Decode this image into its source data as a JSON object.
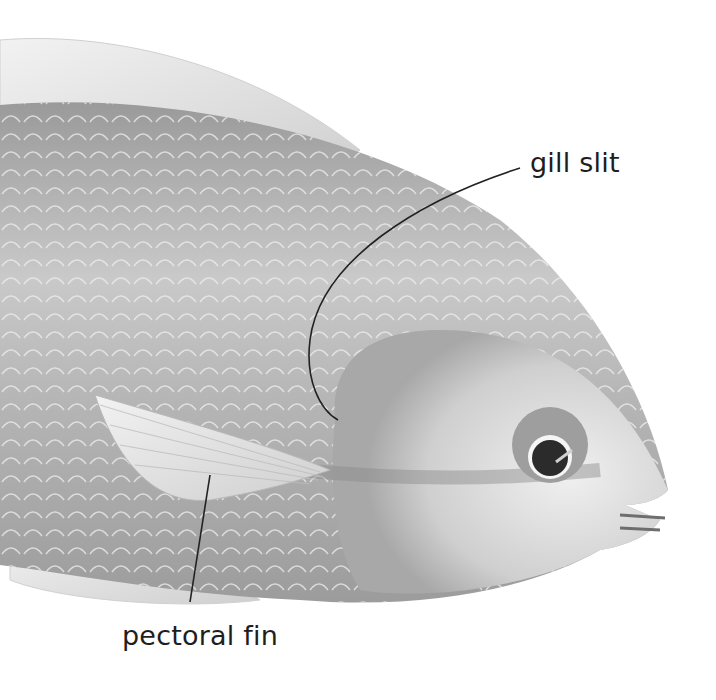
{
  "figure": {
    "colors": {
      "background": "#ffffff",
      "body_light": "#e6e6e6",
      "body_mid": "#bdbdbd",
      "body_dark": "#8c8c8c",
      "line": "#222222",
      "text": "#1e1e1e"
    }
  },
  "labels": {
    "gill_slit": "gill slit",
    "pectoral_fin": "pectoral fin"
  }
}
